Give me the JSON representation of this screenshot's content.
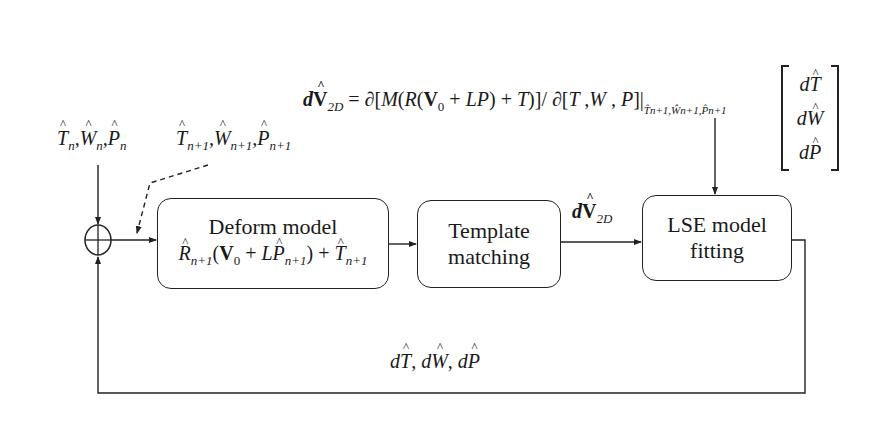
{
  "diagram": {
    "type": "block-diagram",
    "nodes": [
      {
        "id": "sum",
        "shape": "circle-plus",
        "label": ""
      },
      {
        "id": "deform",
        "title": "Deform model",
        "formula": "R̂n+1(V0 + LP̂n+1) + T̂n+1"
      },
      {
        "id": "template",
        "title_line1": "Template",
        "title_line2": "matching"
      },
      {
        "id": "lse",
        "title_line1": "LSE model",
        "title_line2": "fitting"
      }
    ],
    "edges": [
      {
        "from": "input",
        "to": "sum",
        "label": "T̂n, Ŵn, P̂n"
      },
      {
        "from": "sum",
        "to": "deform",
        "style": "solid"
      },
      {
        "from": "estimate",
        "to": "deform-input",
        "label": "T̂n+1, Ŵn+1, P̂n+1",
        "style": "dashed"
      },
      {
        "from": "deform",
        "to": "template",
        "style": "solid"
      },
      {
        "from": "template",
        "to": "lse",
        "label": "dV̂2D"
      },
      {
        "from": "equation",
        "to": "lse",
        "label": "dV̂2D = ∂[M(R(V0 + LP) + T)] / ∂[T,W,P] |T̂n+1,Ŵn+1,P̂n+1 [dT̂; dŴ; dP̂]"
      },
      {
        "from": "lse",
        "to": "sum",
        "label": "dT̂, dŴ, dP̂",
        "style": "feedback"
      }
    ]
  },
  "labels": {
    "input": {
      "T": "T",
      "W": "W",
      "P": "P",
      "sub": "n"
    },
    "estimate": {
      "T": "T",
      "W": "W",
      "P": "P",
      "sub": "n+1"
    },
    "deform_title": "Deform model",
    "deform_formula": {
      "R": "R",
      "sub1": "n+1",
      "V": "V",
      "v0sub": "0",
      "plus1": " + ",
      "L": "L",
      "P": "P",
      "sub2": "n+1",
      "plus2": " + ",
      "T": "T",
      "sub3": "n+1"
    },
    "template_line1": "Template",
    "template_line2": "matching",
    "lse_line1": "LSE model",
    "lse_line2": "fitting",
    "dv2d": {
      "d": "d",
      "V": "V",
      "sub": "2D"
    },
    "equation": {
      "lhs_d": "d",
      "lhs_V": "V",
      "lhs_sub": "2D",
      "eq": " = ∂[",
      "M": "M",
      "body1": "(",
      "R": "R",
      "body2": "(",
      "V": "V",
      "v0sub": "0",
      "body3": " + ",
      "LP": "LP",
      "body4": ") + ",
      "T": "T",
      "body5": ")]/ ∂[",
      "vars": "T ,W , P",
      "body6": "]|",
      "eval_sub": "T̂n+1,Ŵn+1,P̂n+1"
    },
    "matrix": [
      "dT",
      "dW",
      "dP"
    ],
    "feedback": {
      "dT": "dT",
      "dW": "dW",
      "dP": "dP",
      "sep": ", "
    }
  },
  "colors": {
    "stroke": "#222222",
    "background": "#ffffff",
    "text": "#1a1a1a"
  }
}
